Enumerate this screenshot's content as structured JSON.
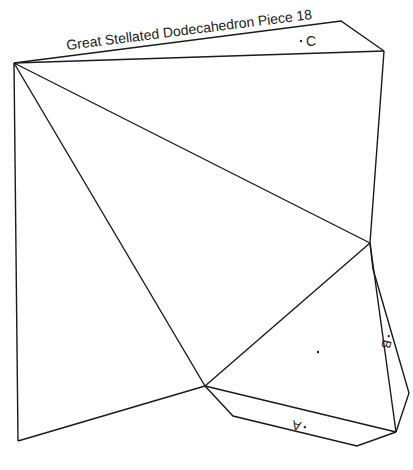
{
  "title": "Great Stellated Dodecahedron Piece 18",
  "labels": {
    "c": "C",
    "b": "B",
    "a": "A"
  },
  "colors": {
    "line": "#1a1a1a",
    "background": "#ffffff"
  },
  "geometry": {
    "vertices": {
      "P1": [
        14,
        63
      ],
      "P2": [
        384,
        51
      ],
      "P3": [
        370,
        243
      ],
      "P4": [
        205,
        386
      ],
      "P5": [
        18,
        441
      ],
      "P6": [
        396,
        432
      ]
    },
    "tabs": {
      "tab_C": [
        [
          14,
          63
        ],
        [
          341,
          21
        ],
        [
          384,
          51
        ]
      ],
      "tab_B": [
        [
          370,
          243
        ],
        [
          373,
          269
        ],
        [
          409,
          393
        ],
        [
          396,
          432
        ]
      ],
      "tab_A": [
        [
          205,
          386
        ],
        [
          233,
          416
        ],
        [
          357,
          446
        ],
        [
          396,
          432
        ]
      ]
    },
    "center_dot": [
      318,
      352
    ]
  }
}
